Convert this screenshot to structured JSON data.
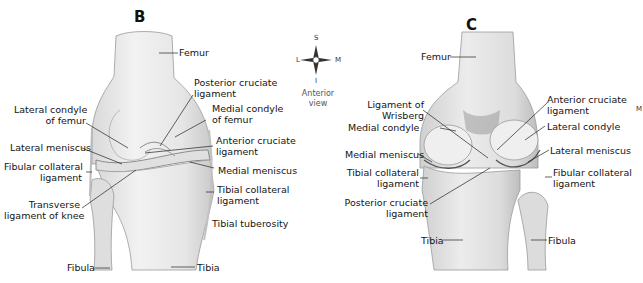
{
  "panels": [
    {
      "letter": "B",
      "view": "anterior",
      "labels": {
        "femur": "Femur",
        "posterior_cruciate_1": "Posterior cruciate",
        "posterior_cruciate_2": "ligament",
        "lateral_condyle_1": "Lateral condyle",
        "lateral_condyle_2": "of femur",
        "medial_condyle_1": "Medial condyle",
        "medial_condyle_2": "of femur",
        "anterior_cruciate_1": "Anterior cruciate",
        "anterior_cruciate_2": "ligament",
        "lateral_meniscus": "Lateral meniscus",
        "medial_meniscus": "Medial meniscus",
        "fibular_collateral_1": "Fibular collateral",
        "fibular_collateral_2": "ligament",
        "tibial_collateral_1": "Tibial collateral",
        "tibial_collateral_2": "ligament",
        "transverse_1": "Transverse",
        "transverse_2": "ligament of knee",
        "tibial_tuberosity": "Tibial tuberosity",
        "fibula": "Fibula",
        "tibia": "Tibia"
      }
    },
    {
      "letter": "C",
      "view": "posterior",
      "labels": {
        "femur": "Femur",
        "wrisberg_1": "Ligament of",
        "wrisberg_2": "Wrisberg",
        "anterior_cruciate_1": "Anterior cruciate",
        "anterior_cruciate_2": "ligament",
        "medial_condyle": "Medial condyle",
        "lateral_condyle": "Lateral condyle",
        "medial_meniscus": "Medial meniscus",
        "lateral_meniscus": "Lateral meniscus",
        "tibial_collateral_1": "Tibial collateral",
        "tibial_collateral_2": "ligament",
        "fibular_collateral_1": "Fibular collateral",
        "fibular_collateral_2": "ligament",
        "posterior_cruciate_1": "Posterior cruciate",
        "posterior_cruciate_2": "ligament",
        "tibia": "Tibia",
        "fibula": "Fibula"
      }
    }
  ],
  "compass": {
    "superior": "S",
    "inferior": "I",
    "lateral": "L",
    "medial": "M",
    "caption_1": "Anterior",
    "caption_2": "view"
  },
  "edge_fragment": "M"
}
